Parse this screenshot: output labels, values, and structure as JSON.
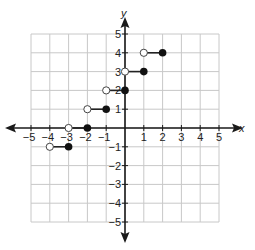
{
  "chart_data": {
    "type": "line",
    "title": "",
    "xlabel": "x",
    "ylabel": "y",
    "xlim": [
      -5,
      5
    ],
    "ylim": [
      -5,
      5
    ],
    "grid": true,
    "x_ticks": [
      "−5",
      "−4",
      "−3",
      "−2",
      "−1",
      "1",
      "2",
      "3",
      "4",
      "5"
    ],
    "y_ticks": [
      "5",
      "4",
      "3",
      "2",
      "1",
      "−1",
      "−2",
      "−3",
      "−4",
      "−5"
    ],
    "function_description": "step function f(x) = ceil(x) + 2",
    "segments": [
      {
        "y": -1,
        "open_x": -4,
        "closed_x": -3
      },
      {
        "y": 0,
        "open_x": -3,
        "closed_x": -2
      },
      {
        "y": 1,
        "open_x": -2,
        "closed_x": -1
      },
      {
        "y": 2,
        "open_x": -1,
        "closed_x": 0
      },
      {
        "y": 3,
        "open_x": 0,
        "closed_x": 1
      },
      {
        "y": 4,
        "open_x": 1,
        "closed_x": 2
      }
    ],
    "colors": {
      "grid": "#c8c8c8",
      "axis": "#1a1a1a",
      "open_fill": "#ffffff",
      "closed_fill": "#111111"
    }
  }
}
